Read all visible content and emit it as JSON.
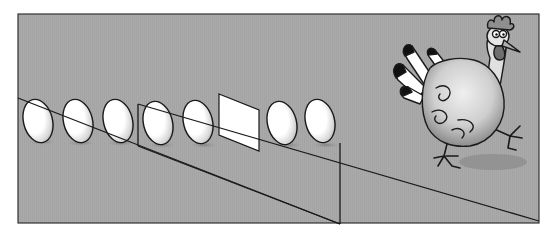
{
  "illustration": {
    "description": "Row of eggs with one replaced by a white square, cartoon rooster walking away",
    "background": "#ffffff",
    "panel_fill": "#a9a9a9",
    "outline": "#1a1a1a",
    "egg_count": 7,
    "eggs_cx": [
      38,
      78,
      118,
      158,
      198,
      285,
      320
    ],
    "square_position_index": 6,
    "colors": {
      "egg_fill": "#ffffff",
      "egg_shade": "#bdbdbd",
      "shadow": "#8e8e8e",
      "rooster_body": "#d4d4d4",
      "rooster_dark": "#6f6f6f",
      "feather_black": "#111111"
    }
  }
}
